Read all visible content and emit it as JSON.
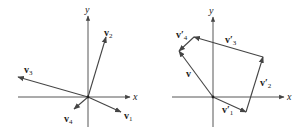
{
  "left_diagram": {
    "axis_labels": {
      "x": "x",
      "y": "y"
    },
    "origin": [
      88,
      97
    ],
    "vectors": [
      {
        "name": "v",
        "sub": "1",
        "tip": [
          121,
          112
        ]
      },
      {
        "name": "v",
        "sub": "2",
        "tip": [
          106,
          37
        ]
      },
      {
        "name": "v",
        "sub": "3",
        "tip": [
          18,
          77
        ]
      },
      {
        "name": "v",
        "sub": "4",
        "tip": [
          74,
          109
        ]
      }
    ]
  },
  "right_diagram": {
    "axis_labels": {
      "x": "x",
      "y": "y"
    },
    "origin": [
      213,
      97
    ],
    "path_vectors": [
      {
        "name": "v",
        "prime": "′",
        "sub": "1"
      },
      {
        "name": "v",
        "prime": "′",
        "sub": "2"
      },
      {
        "name": "v",
        "prime": "′",
        "sub": "3"
      },
      {
        "name": "v",
        "prime": "′",
        "sub": "4"
      }
    ],
    "resultant": {
      "name": "v"
    }
  },
  "colors": {
    "stroke": "#444444",
    "text": "#222222",
    "background": "#ffffff"
  }
}
